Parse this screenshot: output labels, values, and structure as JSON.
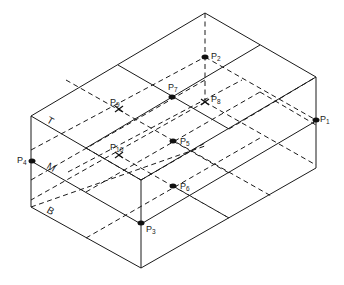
{
  "diagram": {
    "layers": [
      {
        "id": "T",
        "label": "T",
        "x": 46,
        "y": 122,
        "rot": 30
      },
      {
        "id": "M",
        "label": "M",
        "x": 46,
        "y": 168,
        "rot": 30
      },
      {
        "id": "B",
        "label": "B",
        "x": 46,
        "y": 212,
        "rot": 30
      }
    ],
    "points": [
      {
        "id": "P1",
        "base": "P",
        "sub": "1",
        "x": 316,
        "y": 120,
        "marker": "dot",
        "lx": 320,
        "ly": 122
      },
      {
        "id": "P2",
        "base": "P",
        "sub": "2",
        "x": 205,
        "y": 57,
        "marker": "dot",
        "lx": 211,
        "ly": 59
      },
      {
        "id": "P3",
        "base": "P",
        "sub": "3",
        "x": 141,
        "y": 223,
        "marker": "dot",
        "lx": 146,
        "ly": 232
      },
      {
        "id": "P4",
        "base": "P",
        "sub": "4",
        "x": 32,
        "y": 161,
        "marker": "dot",
        "lx": 17,
        "ly": 163
      },
      {
        "id": "P5",
        "base": "P",
        "sub": "5",
        "x": 173,
        "y": 141,
        "marker": "dot",
        "lx": 180,
        "ly": 144
      },
      {
        "id": "P6",
        "base": "P",
        "sub": "6",
        "x": 173,
        "y": 186,
        "marker": "dot",
        "lx": 180,
        "ly": 189
      },
      {
        "id": "P7",
        "base": "P",
        "sub": "7",
        "x": 172,
        "y": 97,
        "marker": "dot",
        "lx": 168,
        "ly": 90
      },
      {
        "id": "P8",
        "base": "P",
        "sub": "8",
        "x": 205,
        "y": 102,
        "marker": "cross",
        "lx": 211,
        "ly": 102
      },
      {
        "id": "P9",
        "base": "P",
        "sub": "9",
        "x": 119,
        "y": 109,
        "marker": "cross",
        "lx": 110,
        "ly": 105
      },
      {
        "id": "P10",
        "base": "P",
        "sub": "10",
        "x": 119,
        "y": 155,
        "marker": "cross",
        "lx": 110,
        "ly": 150
      }
    ]
  }
}
